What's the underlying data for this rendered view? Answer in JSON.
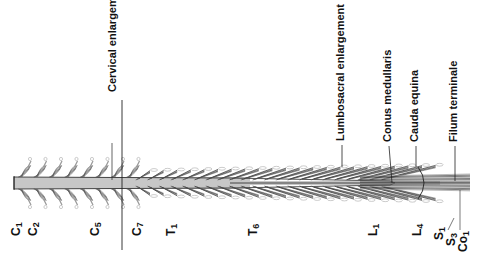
{
  "diagram": {
    "structures": [
      {
        "id": "cervical",
        "label": "Cervical enlargement",
        "x": 118,
        "text_y": 92
      },
      {
        "id": "lumbosacral",
        "label": "Lumbosacral enlargement",
        "x": 346,
        "text_y": 141
      },
      {
        "id": "conus",
        "label": "Conus medullaris",
        "x": 393,
        "text_y": 142
      },
      {
        "id": "cauda",
        "label": "Cauda equina",
        "x": 420,
        "text_y": 142
      },
      {
        "id": "filum",
        "label": "Filum terminale",
        "x": 459,
        "text_y": 142
      }
    ],
    "segments": [
      {
        "id": "c1",
        "letter": "C",
        "num": "1",
        "x": 17
      },
      {
        "id": "c2",
        "letter": "C",
        "num": "2",
        "x": 34
      },
      {
        "id": "c5",
        "letter": "C",
        "num": "5",
        "x": 96
      },
      {
        "id": "c7",
        "letter": "C",
        "num": "7",
        "x": 138
      },
      {
        "id": "t1",
        "letter": "T",
        "num": "1",
        "x": 172
      },
      {
        "id": "t6",
        "letter": "T",
        "num": "6",
        "x": 254
      },
      {
        "id": "l1",
        "letter": "L",
        "num": "1",
        "x": 374
      },
      {
        "id": "l4",
        "letter": "L",
        "num": "4",
        "x": 418
      },
      {
        "id": "s1",
        "letter": "S",
        "num": "1",
        "x": 440
      },
      {
        "id": "s3",
        "letter": "S",
        "num": "3",
        "x": 452
      },
      {
        "id": "co1",
        "letter": "Co",
        "num": "1",
        "x": 464
      }
    ],
    "colors": {
      "ink": "#111111",
      "fiber": "#555555",
      "cord_fill": "#ffffff",
      "root_light": "#bbbbbb"
    }
  }
}
